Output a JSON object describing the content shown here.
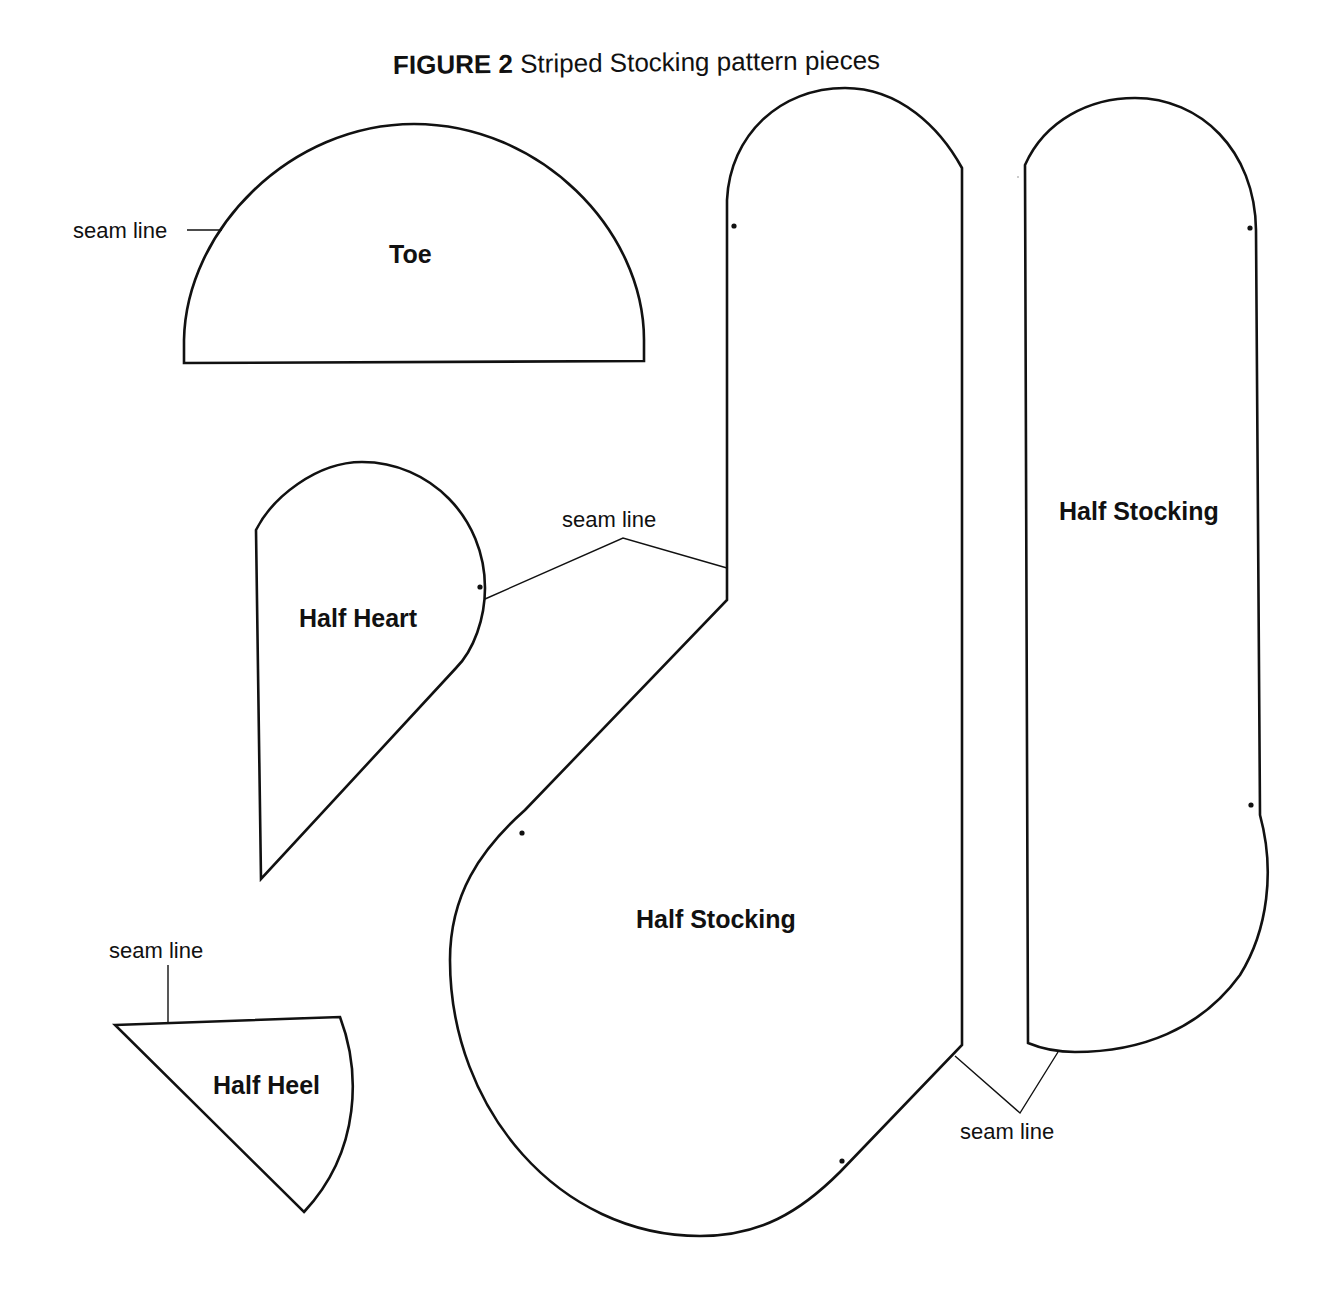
{
  "figure": {
    "number_label": "FIGURE 2",
    "caption": "Striped Stocking pattern pieces"
  },
  "pieces": {
    "toe": {
      "label": "Toe"
    },
    "half_heart": {
      "label": "Half Heart"
    },
    "half_heel": {
      "label": "Half Heel"
    },
    "half_stocking_foot": {
      "label": "Half Stocking"
    },
    "half_stocking_leg": {
      "label": "Half Stocking"
    }
  },
  "annotations": {
    "toe_seam": "seam line",
    "heart_stocking_seam": "seam line",
    "heel_seam": "seam line",
    "stocking_bottom_seam": "seam line"
  },
  "colors": {
    "line": "#111111",
    "background": "#ffffff"
  }
}
